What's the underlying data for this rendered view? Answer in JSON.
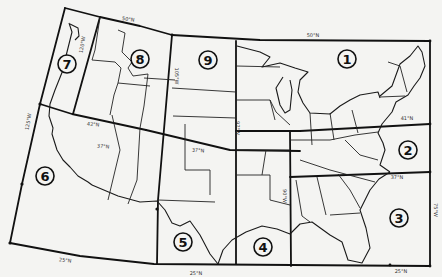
{
  "map": {
    "title": "",
    "colors": {
      "ink": "#111111",
      "paper": "#f4f4f2"
    },
    "regions": [
      {
        "id": "1",
        "label": "1",
        "x": 347,
        "y": 59
      },
      {
        "id": "2",
        "label": "2",
        "x": 408,
        "y": 150
      },
      {
        "id": "3",
        "label": "3",
        "x": 399,
        "y": 218
      },
      {
        "id": "4",
        "label": "4",
        "x": 263,
        "y": 247
      },
      {
        "id": "5",
        "label": "5",
        "x": 183,
        "y": 242
      },
      {
        "id": "6",
        "label": "6",
        "x": 45,
        "y": 176
      },
      {
        "id": "7",
        "label": "7",
        "x": 67,
        "y": 64
      },
      {
        "id": "8",
        "label": "8",
        "x": 140,
        "y": 59
      },
      {
        "id": "9",
        "label": "9",
        "x": 208,
        "y": 60
      }
    ],
    "grid_labels": [
      {
        "text": "50°N",
        "x": 128,
        "y": 21,
        "rotate": 8
      },
      {
        "text": "50°N",
        "x": 313,
        "y": 37,
        "rotate": 0
      },
      {
        "text": "41°N",
        "x": 407,
        "y": 120,
        "rotate": 0
      },
      {
        "text": "37°N",
        "x": 397,
        "y": 179,
        "rotate": 0
      },
      {
        "text": "120°W",
        "x": 84,
        "y": 45,
        "rotate": -80
      },
      {
        "text": "105°W",
        "x": 175,
        "y": 76,
        "rotate": 90
      },
      {
        "text": "97°W",
        "x": 236,
        "y": 128,
        "rotate": 90
      },
      {
        "text": "90°W",
        "x": 283,
        "y": 196,
        "rotate": 90
      },
      {
        "text": "75°W",
        "x": 434,
        "y": 210,
        "rotate": 90
      },
      {
        "text": "125°W",
        "x": 30,
        "y": 122,
        "rotate": -80
      },
      {
        "text": "42°N",
        "x": 93,
        "y": 126,
        "rotate": 5
      },
      {
        "text": "37°N",
        "x": 103,
        "y": 148,
        "rotate": 5
      },
      {
        "text": "37°N",
        "x": 198,
        "y": 152,
        "rotate": 3
      },
      {
        "text": "25°N",
        "x": 65,
        "y": 262,
        "rotate": 7
      },
      {
        "text": "25°N",
        "x": 196,
        "y": 275,
        "rotate": 0
      },
      {
        "text": "25°N",
        "x": 401,
        "y": 273,
        "rotate": 0
      }
    ]
  }
}
